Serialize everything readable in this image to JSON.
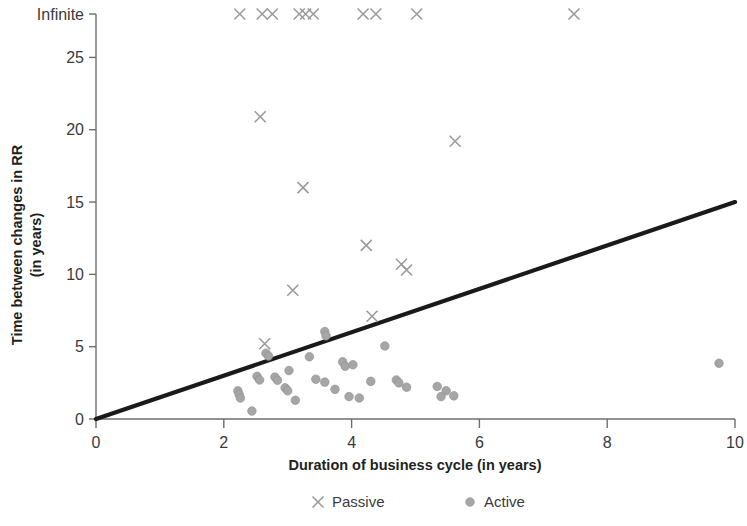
{
  "chart_data": {
    "type": "scatter",
    "title": "",
    "xlabel": "Duration of business cycle (in years)",
    "ylabel": "Time between changes in RR\n(in years)",
    "ylabel_line1": "Time between changes in RR",
    "ylabel_line2": "(in years)",
    "xlim": [
      0,
      10
    ],
    "ylim": [
      0,
      28
    ],
    "xticks": [
      0,
      2,
      4,
      6,
      8,
      10
    ],
    "xtick_labels": [
      "0",
      "2",
      "4",
      "6",
      "8",
      "10"
    ],
    "yticks": [
      0,
      5,
      10,
      15,
      20,
      25,
      28
    ],
    "ytick_labels": [
      "0",
      "5",
      "10",
      "15",
      "20",
      "25",
      "Infinite"
    ],
    "grid": false,
    "legend_position": "bottom",
    "infinite_value": 28,
    "trendline": {
      "x": [
        0,
        10
      ],
      "y": [
        0,
        15
      ],
      "slope": 1.5,
      "intercept": 0,
      "color": "#1a1a1a"
    },
    "series": [
      {
        "name": "Passive",
        "marker": "x",
        "color": "#9b9b9b",
        "points": [
          {
            "x": 2.25,
            "y": "Infinite"
          },
          {
            "x": 2.6,
            "y": "Infinite"
          },
          {
            "x": 2.76,
            "y": "Infinite"
          },
          {
            "x": 3.18,
            "y": "Infinite"
          },
          {
            "x": 3.28,
            "y": "Infinite"
          },
          {
            "x": 3.4,
            "y": "Infinite"
          },
          {
            "x": 4.18,
            "y": "Infinite"
          },
          {
            "x": 4.38,
            "y": "Infinite"
          },
          {
            "x": 5.02,
            "y": "Infinite"
          },
          {
            "x": 7.48,
            "y": "Infinite"
          },
          {
            "x": 2.57,
            "y": 20.9
          },
          {
            "x": 5.62,
            "y": 19.2
          },
          {
            "x": 3.24,
            "y": 16.0
          },
          {
            "x": 4.23,
            "y": 12.0
          },
          {
            "x": 4.78,
            "y": 10.7
          },
          {
            "x": 4.86,
            "y": 10.3
          },
          {
            "x": 3.08,
            "y": 8.9
          },
          {
            "x": 4.32,
            "y": 7.1
          },
          {
            "x": 2.64,
            "y": 5.2
          }
        ]
      },
      {
        "name": "Active",
        "marker": "circle",
        "color": "#a6a6a6",
        "points": [
          {
            "x": 2.66,
            "y": 4.55
          },
          {
            "x": 2.7,
            "y": 4.35
          },
          {
            "x": 3.58,
            "y": 6.05
          },
          {
            "x": 3.6,
            "y": 5.75
          },
          {
            "x": 4.52,
            "y": 5.05
          },
          {
            "x": 3.34,
            "y": 4.3
          },
          {
            "x": 3.86,
            "y": 3.95
          },
          {
            "x": 3.9,
            "y": 3.65
          },
          {
            "x": 4.02,
            "y": 3.75
          },
          {
            "x": 3.02,
            "y": 3.35
          },
          {
            "x": 2.52,
            "y": 2.95
          },
          {
            "x": 2.56,
            "y": 2.7
          },
          {
            "x": 2.8,
            "y": 2.9
          },
          {
            "x": 2.84,
            "y": 2.68
          },
          {
            "x": 3.44,
            "y": 2.75
          },
          {
            "x": 3.58,
            "y": 2.55
          },
          {
            "x": 4.3,
            "y": 2.6
          },
          {
            "x": 2.96,
            "y": 2.15
          },
          {
            "x": 3.0,
            "y": 1.95
          },
          {
            "x": 2.22,
            "y": 1.95
          },
          {
            "x": 2.24,
            "y": 1.7
          },
          {
            "x": 2.26,
            "y": 1.45
          },
          {
            "x": 3.12,
            "y": 1.3
          },
          {
            "x": 3.74,
            "y": 2.05
          },
          {
            "x": 3.96,
            "y": 1.55
          },
          {
            "x": 4.12,
            "y": 1.45
          },
          {
            "x": 4.7,
            "y": 2.7
          },
          {
            "x": 4.74,
            "y": 2.5
          },
          {
            "x": 4.86,
            "y": 2.2
          },
          {
            "x": 5.34,
            "y": 2.25
          },
          {
            "x": 5.48,
            "y": 1.95
          },
          {
            "x": 5.4,
            "y": 1.55
          },
          {
            "x": 5.6,
            "y": 1.6
          },
          {
            "x": 2.44,
            "y": 0.55
          },
          {
            "x": 9.75,
            "y": 3.85
          }
        ]
      }
    ],
    "legend": [
      {
        "label": "Passive",
        "marker": "x",
        "color": "#9b9b9b"
      },
      {
        "label": "Active",
        "marker": "circle",
        "color": "#a6a6a6"
      }
    ]
  }
}
